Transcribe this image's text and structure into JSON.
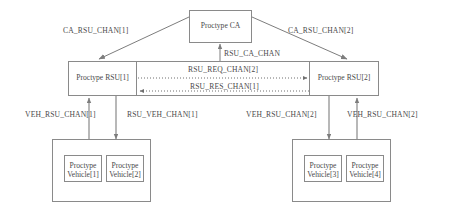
{
  "diagram": {
    "colors": {
      "stroke": "#8a8a8a",
      "text": "#4a4a4a",
      "background": "#ffffff"
    },
    "nodes": {
      "ca": {
        "label": "Proctype CA"
      },
      "rsu1": {
        "label": "Proctype RSU[1]"
      },
      "rsu2": {
        "label": "Proctype RSU[2]"
      },
      "vehicle1": {
        "line1": "Proctype",
        "line2": "Vehicle[1]"
      },
      "vehicle2": {
        "line1": "Proctype",
        "line2": "Vehicle[2]"
      },
      "vehicle3": {
        "line1": "Proctype",
        "line2": "Vehicle[3]"
      },
      "vehicle4": {
        "line1": "Proctype",
        "line2": "Vehicle[4]"
      }
    },
    "channels": {
      "ca_rsu_chan_1": "CA_RSU_CHAN[1]",
      "ca_rsu_chan_2": "CA_RSU_CHAN[2]",
      "rsu_ca_chan": "RSU_CA_CHAN",
      "rsu_req_chan_2": "RSU_REQ_CHAN[2]",
      "rsu_res_chan_1": "RSU_RES_CHAN[1]",
      "veh_rsu_chan_1": "VEH_RSU_CHAN[1]",
      "rsu_veh_chan_1": "RSU_VEH_CHAN[1]",
      "veh_rsu_chan_2a": "VEH_RSU_CHAN[2]",
      "veh_rsu_chan_2b": "VEH_RSU_CHAN[2]"
    }
  }
}
